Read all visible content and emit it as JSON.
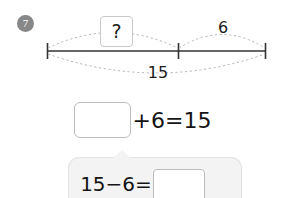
{
  "problem": {
    "number_label": "7"
  },
  "number_line": {
    "unknown_marker": "?",
    "right_part_label": "6",
    "total_label": "15",
    "left_tick_x": 47,
    "middle_tick_x": 178,
    "right_tick_x": 266,
    "line_y": 51,
    "line_color": "#333333",
    "arc_color": "#b5b5b5"
  },
  "equation": {
    "answer_placeholder": "",
    "expression": "+6=15"
  },
  "hint": {
    "expression": "15−6=",
    "answer_placeholder": "",
    "panel_color": "#f3f3f3"
  }
}
